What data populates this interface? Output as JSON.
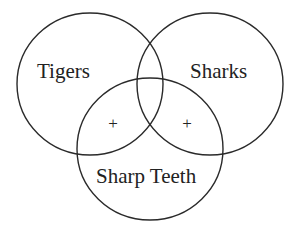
{
  "diagram": {
    "type": "venn",
    "sets": [
      {
        "label": "Tigers",
        "cx": 90,
        "cy": 84,
        "rx": 73,
        "ry": 71
      },
      {
        "label": "Sharks",
        "cx": 210,
        "cy": 84,
        "rx": 73,
        "ry": 71
      },
      {
        "label": "Sharp Teeth",
        "cx": 150,
        "cy": 149,
        "rx": 73,
        "ry": 71
      }
    ],
    "markers": [
      {
        "symbol": "+",
        "region": "Tigers ∩ Sharp Teeth (not Sharks)",
        "x": 113,
        "y": 128
      },
      {
        "symbol": "+",
        "region": "Sharks ∩ Sharp Teeth (not Tigers)",
        "x": 187,
        "y": 128
      }
    ],
    "stroke_color": "#2a2a2a",
    "text_color": "#222222"
  }
}
